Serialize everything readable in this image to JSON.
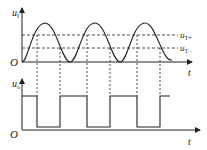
{
  "diagram": {
    "top_panel": {
      "y_axis_label": "u",
      "y_axis_sub": "I",
      "x_axis_label": "t",
      "origin_label": "O",
      "threshold_high_label": "u",
      "threshold_high_sub": "T+",
      "threshold_low_label": "u",
      "threshold_low_sub": "T−"
    },
    "bottom_panel": {
      "y_axis_label": "u",
      "y_axis_sub": "o",
      "x_axis_label": "t",
      "origin_label": "O"
    },
    "colors": {
      "line": "#222222",
      "background": "#ffffff"
    }
  }
}
